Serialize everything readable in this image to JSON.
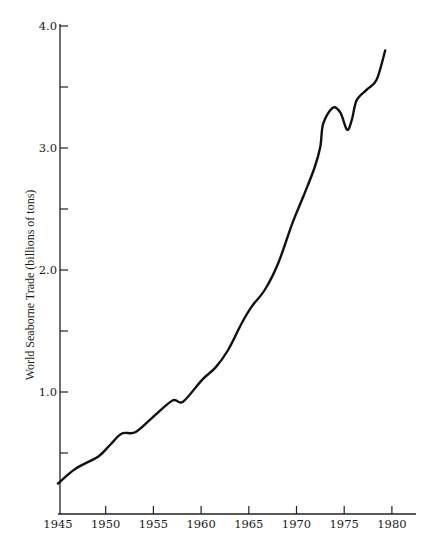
{
  "chart_data": {
    "type": "line",
    "title": "",
    "xlabel": "",
    "ylabel": "World Seaborne Trade (billions of tons)",
    "xlim": [
      1945,
      1982
    ],
    "ylim": [
      0,
      4.0
    ],
    "grid": false,
    "legend": null,
    "x_ticks": [
      1945,
      1950,
      1955,
      1960,
      1965,
      1970,
      1975,
      1980
    ],
    "x_tick_labels": [
      "1945",
      "1950",
      "1955",
      "1960",
      "1965",
      "1970",
      "1975",
      "1980"
    ],
    "y_ticks": [
      0.5,
      1.0,
      1.5,
      2.0,
      2.5,
      3.0,
      3.5,
      4.0
    ],
    "y_tick_labels": [
      "",
      "1.0",
      "",
      "2.0",
      "",
      "3.0",
      "",
      "4.0"
    ],
    "series": [
      {
        "name": "World Seaborne Trade",
        "x": [
          1945,
          1946.8,
          1949.2,
          1950.5,
          1951.7,
          1953.1,
          1954.9,
          1957.0,
          1958.1,
          1960.1,
          1961.5,
          1962.8,
          1964.3,
          1965.3,
          1966.7,
          1968.1,
          1969.6,
          1970.7,
          1971.9,
          1972.5,
          1972.8,
          1973.8,
          1974.6,
          1975.3,
          1975.8,
          1976.3,
          1977.4,
          1978.4,
          1979.3
        ],
        "values": [
          0.25,
          0.37,
          0.47,
          0.57,
          0.66,
          0.67,
          0.79,
          0.93,
          0.92,
          1.1,
          1.2,
          1.34,
          1.57,
          1.7,
          1.84,
          2.06,
          2.39,
          2.6,
          2.84,
          3.01,
          3.2,
          3.33,
          3.29,
          3.15,
          3.23,
          3.39,
          3.48,
          3.56,
          3.8
        ],
        "color": "#111111"
      }
    ]
  },
  "layout": {
    "plot": {
      "x0": 60,
      "y0": 514,
      "x_axis_end": 416,
      "y_axis_top": 24
    },
    "x_map": {
      "x1945": 58,
      "px_per_year": 9.54
    },
    "y_map": {
      "px_per_unit": 122
    }
  }
}
